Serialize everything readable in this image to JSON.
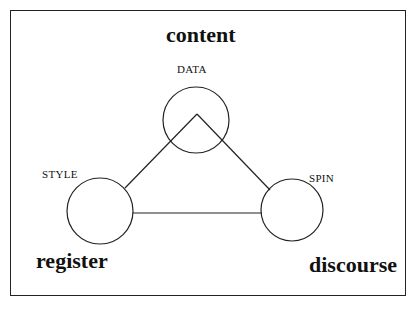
{
  "diagram": {
    "title_top": "content",
    "title_left": "register",
    "title_right": "discourse",
    "nodes": [
      {
        "id": "data",
        "label": "DATA"
      },
      {
        "id": "style",
        "label": "STYLE"
      },
      {
        "id": "spin",
        "label": "SPIN"
      }
    ],
    "edges": [
      {
        "from": "data",
        "to": "style"
      },
      {
        "from": "data",
        "to": "spin"
      },
      {
        "from": "style",
        "to": "spin"
      }
    ],
    "colors": {
      "stroke": "#222222",
      "background": "#ffffff"
    }
  }
}
